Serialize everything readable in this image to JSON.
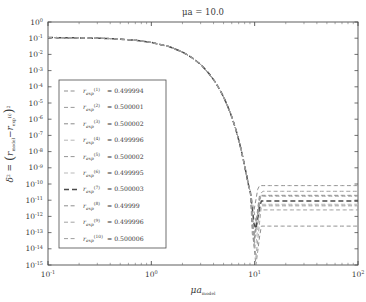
{
  "chart_data": {
    "type": "line",
    "title": "μa = 10.0",
    "title_plain": "mu a = 10.0",
    "xlabel": "μa_model",
    "ylabel": "δ² = (r_model - r_exp^(i))²",
    "xscale": "log",
    "yscale": "log",
    "xlim": [
      0.1,
      100
    ],
    "ylim": [
      1e-15,
      1
    ],
    "xticks": [
      "10⁻¹",
      "10⁰",
      "10¹",
      "10²"
    ],
    "xtick_values": [
      0.1,
      1,
      10,
      100
    ],
    "ytick_values": [
      1,
      0.1,
      0.01,
      0.001,
      0.0001,
      1e-05,
      1e-06,
      1e-07,
      1e-08,
      1e-09,
      1e-10,
      1e-11,
      1e-12,
      1e-13,
      1e-14,
      1e-15
    ],
    "ytick_exponents": [
      0,
      -1,
      -2,
      -3,
      -4,
      -5,
      -6,
      -7,
      -8,
      -9,
      -10,
      -11,
      -12,
      -13,
      -14,
      -15
    ],
    "grid": false,
    "legend_position": "center-left",
    "linestyle": "dashed",
    "series": [
      {
        "name": "r_exp^(1)",
        "index": 1,
        "value": "0.499994",
        "plateau_exponent": -10.1,
        "color": "#8f8f8f"
      },
      {
        "name": "r_exp^(2)",
        "index": 2,
        "value": "0.500001",
        "plateau_exponent": -11.6,
        "color": "#9a9a9a"
      },
      {
        "name": "r_exp^(3)",
        "index": 3,
        "value": "0.500002",
        "plateau_exponent": -10.7,
        "color": "#8a8a8a"
      },
      {
        "name": "r_exp^(4)",
        "index": 4,
        "value": "0.499996",
        "plateau_exponent": -11.3,
        "color": "#b5b5b5"
      },
      {
        "name": "r_exp^(5)",
        "index": 5,
        "value": "0.500002",
        "plateau_exponent": -10.75,
        "color": "#969696"
      },
      {
        "name": "r_exp^(6)",
        "index": 6,
        "value": "0.499995",
        "plateau_exponent": -11.25,
        "color": "#b9b9b9"
      },
      {
        "name": "r_exp^(7)",
        "index": 7,
        "value": "0.500003",
        "plateau_exponent": -11.05,
        "color": "#4a4a4a"
      },
      {
        "name": "r_exp^(8)",
        "index": 8,
        "value": "0.49999",
        "plateau_exponent": -12.6,
        "color": "#8d8d8d"
      },
      {
        "name": "r_exp^(9)",
        "index": 9,
        "value": "0.499996",
        "plateau_exponent": -11.35,
        "color": "#a3a3a3"
      },
      {
        "name": "r_exp^(10)",
        "index": 10,
        "value": "0.500006",
        "plateau_exponent": -10.45,
        "color": "#9e9e9e"
      }
    ],
    "curve_description": "All ten series overlap along a common dashed descent from δ²≈10⁻¹ at μa_model=0.1, falling steeply past μa_model≈7 and splitting into individual plateaus between 10⁻¹⁰ and 10⁻¹³ for μa_model>10.",
    "descent_points": [
      {
        "x": 0.1,
        "y": 0.11
      },
      {
        "x": 0.2,
        "y": 0.105
      },
      {
        "x": 0.4,
        "y": 0.095
      },
      {
        "x": 0.7,
        "y": 0.075
      },
      {
        "x": 1.0,
        "y": 0.055
      },
      {
        "x": 1.5,
        "y": 0.03
      },
      {
        "x": 2.0,
        "y": 0.014
      },
      {
        "x": 2.5,
        "y": 0.006
      },
      {
        "x": 3.0,
        "y": 0.0024
      },
      {
        "x": 3.5,
        "y": 0.00085
      },
      {
        "x": 4.0,
        "y": 0.00028
      },
      {
        "x": 4.5,
        "y": 8.5e-05
      },
      {
        "x": 5.0,
        "y": 2.4e-05
      },
      {
        "x": 5.5,
        "y": 6e-06
      },
      {
        "x": 6.0,
        "y": 1.4e-06
      },
      {
        "x": 6.5,
        "y": 3e-07
      },
      {
        "x": 7.0,
        "y": 5.5e-08
      },
      {
        "x": 7.5,
        "y": 9e-09
      },
      {
        "x": 8.0,
        "y": 1.3e-09
      },
      {
        "x": 8.5,
        "y": 2e-10
      },
      {
        "x": 9.0,
        "y": 3e-11
      }
    ],
    "legend_entries": [
      {
        "label_base": "r",
        "sub": "exp",
        "sup": "(1)",
        "eq": "= 0.499994"
      },
      {
        "label_base": "r",
        "sub": "exp",
        "sup": "(2)",
        "eq": "= 0.500001"
      },
      {
        "label_base": "r",
        "sub": "exp",
        "sup": "(3)",
        "eq": "= 0.500002"
      },
      {
        "label_base": "r",
        "sub": "exp",
        "sup": "(4)",
        "eq": "= 0.499996"
      },
      {
        "label_base": "r",
        "sub": "exp",
        "sup": "(5)",
        "eq": "= 0.500002"
      },
      {
        "label_base": "r",
        "sub": "exp",
        "sup": "(6)",
        "eq": "= 0.499995"
      },
      {
        "label_base": "r",
        "sub": "exp",
        "sup": "(7)",
        "eq": "= 0.500003"
      },
      {
        "label_base": "r",
        "sub": "exp",
        "sup": "(8)",
        "eq": "= 0.49999"
      },
      {
        "label_base": "r",
        "sub": "exp",
        "sup": "(9)",
        "eq": "= 0.499996"
      },
      {
        "label_base": "r",
        "sub": "exp",
        "sup": "(10)",
        "eq": "= 0.500006"
      }
    ]
  },
  "figure": {
    "background": "#ffffff",
    "frame_color": "#4d4d4d",
    "text_color": "#3a3a3a"
  }
}
